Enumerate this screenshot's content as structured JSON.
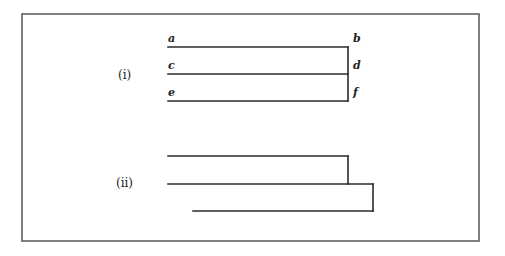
{
  "figure": {
    "frame": {
      "x1": 22,
      "y1": 14,
      "x2": 479,
      "y2": 241,
      "color": "#555555"
    },
    "line_color": "#2a2a2a",
    "part_i": {
      "label": "(i)",
      "label_pos": {
        "x": 118,
        "y": 79
      },
      "horizontal_lines": [
        {
          "name": "a-b",
          "x1": 168,
          "y": 47,
          "x2": 348
        },
        {
          "name": "c-d",
          "x1": 168,
          "y": 74,
          "x2": 348
        },
        {
          "name": "e-f",
          "x1": 168,
          "y": 101,
          "x2": 348
        }
      ],
      "vertical_line": {
        "x": 348,
        "y1": 47,
        "y2": 101
      },
      "point_labels": [
        {
          "text": "a",
          "x": 168,
          "y": 42
        },
        {
          "text": "b",
          "x": 353,
          "y": 42
        },
        {
          "text": "c",
          "x": 168,
          "y": 69
        },
        {
          "text": "d",
          "x": 353,
          "y": 69
        },
        {
          "text": "e",
          "x": 168,
          "y": 96
        },
        {
          "text": "f",
          "x": 353,
          "y": 96
        }
      ]
    },
    "part_ii": {
      "label": "(ii)",
      "label_pos": {
        "x": 116,
        "y": 187
      },
      "horizontal_lines": [
        {
          "name": "top",
          "x1": 168,
          "y": 156,
          "x2": 348
        },
        {
          "name": "middle",
          "x1": 168,
          "y": 184,
          "x2": 373
        },
        {
          "name": "bottom",
          "x1": 193,
          "y": 211,
          "x2": 373
        }
      ],
      "vertical_lines": [
        {
          "name": "join-top-middle",
          "x": 348,
          "y1": 156,
          "y2": 184
        },
        {
          "name": "join-middle-bottom",
          "x": 373,
          "y1": 184,
          "y2": 211
        }
      ]
    }
  }
}
